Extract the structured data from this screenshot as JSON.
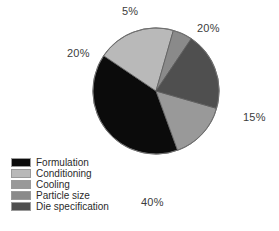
{
  "chart_data": {
    "type": "pie",
    "title": "",
    "subtitle": "",
    "xlabel": "",
    "ylabel": "",
    "grid": false,
    "legend_position": "bottom-left",
    "categories": [
      "Formulation",
      "Conditioning",
      "Cooling",
      "Particle size",
      "Die specification"
    ],
    "values": [
      40,
      20,
      15,
      5,
      20
    ],
    "value_unit": "%",
    "data_labels": [
      "40%",
      "20%",
      "15%",
      "5%",
      "20%"
    ],
    "colors": [
      "#0b0b0b",
      "#b9b9b9",
      "#999999",
      "#8a8a8a",
      "#4f4f4f"
    ],
    "slices": [
      {
        "label": "Formulation",
        "value": 40,
        "data_label": "40%",
        "color": "#0b0b0b",
        "start_angle": 160,
        "end_angle": 304
      },
      {
        "label": "Conditioning",
        "value": 20,
        "data_label": "20%",
        "color": "#b9b9b9",
        "start_angle": 304,
        "end_angle": 16
      },
      {
        "label": "Cooling",
        "value": 15,
        "data_label": "15%",
        "color": "#999999",
        "start_angle": 106,
        "end_angle": 160
      },
      {
        "label": "Particle size",
        "value": 5,
        "data_label": "5%",
        "color": "#8a8a8a",
        "start_angle": 16,
        "end_angle": 34
      },
      {
        "label": "Die specification",
        "value": 20,
        "data_label": "20%",
        "color": "#4f4f4f",
        "start_angle": 34,
        "end_angle": 106
      }
    ]
  },
  "labels": {
    "particle_size_pct": "5%",
    "die_specification_pct": "20%",
    "cooling_pct": "15%",
    "conditioning_pct": "20%",
    "formulation_pct": "40%"
  },
  "legend": {
    "items": [
      {
        "label": "Formulation",
        "color": "#0b0b0b"
      },
      {
        "label": "Conditioning",
        "color": "#b9b9b9"
      },
      {
        "label": "Cooling",
        "color": "#999999"
      },
      {
        "label": "Particle size",
        "color": "#8a8a8a"
      },
      {
        "label": "Die specification",
        "color": "#4f4f4f"
      }
    ]
  }
}
